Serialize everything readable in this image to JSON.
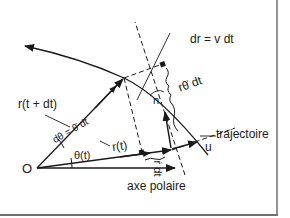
{
  "diagram": {
    "type": "polar kinematics (trajectory with radial & orthoradial displacement)",
    "labels": {
      "origin": "O",
      "polar_axis": "axe polaire",
      "trajectory": "trajectoire",
      "r_t": "r(t)",
      "r_t_dt": "r(t + dt)",
      "theta_t": "θ(t)",
      "dtheta": "dθ = θ̇ dt",
      "dr_eq": "dr = v dt",
      "r_thetadot_dt": "rθ̇ dt",
      "rdot_dt": "ṙ dt",
      "n_vec": "n",
      "u_vec": "u"
    },
    "colors": {
      "background": "#ffffff",
      "ink": "#1a1a1a",
      "frame": "#6f6f6f"
    }
  }
}
